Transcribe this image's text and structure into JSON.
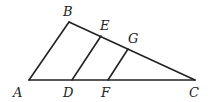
{
  "figure": {
    "type": "triangle-with-parallel-segments",
    "points": {
      "A": {
        "x": 29,
        "y": 80
      },
      "B": {
        "x": 69,
        "y": 22
      },
      "C": {
        "x": 195,
        "y": 80
      },
      "D": {
        "x": 72,
        "y": 80
      },
      "E": {
        "x": 101,
        "y": 36
      },
      "F": {
        "x": 108,
        "y": 80
      },
      "G": {
        "x": 128,
        "y": 49
      }
    },
    "segments": [
      [
        "A",
        "B"
      ],
      [
        "B",
        "C"
      ],
      [
        "A",
        "C"
      ],
      [
        "D",
        "E"
      ],
      [
        "F",
        "G"
      ]
    ],
    "labels": {
      "A": "A",
      "B": "B",
      "C": "C",
      "D": "D",
      "E": "E",
      "F": "F",
      "G": "G"
    },
    "stroke_color": "#222222"
  }
}
